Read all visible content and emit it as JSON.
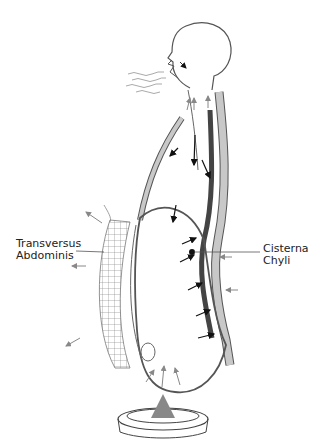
{
  "diagram": {
    "type": "anatomical-illustration",
    "labels": {
      "left": {
        "line1": "Transversus",
        "line2": "Abdominis"
      },
      "right": {
        "line1": "Cisterna",
        "line2": "Chyli"
      }
    },
    "elements": [
      "head-outline",
      "exhaled-breath-lines",
      "spine-column",
      "thoracic-duct",
      "front-chest-wall",
      "diaphragm-dome",
      "abdominal-cavity",
      "transversus-abdominis-mesh",
      "pelvic-floor-ring",
      "upward-pelvic-arrow"
    ],
    "colors": {
      "outline": "#555555",
      "spine_fill": "#c8c8c8",
      "thoracic_duct": "#444444",
      "arrows_dark": "#111111",
      "arrows_gray": "#888888"
    }
  }
}
